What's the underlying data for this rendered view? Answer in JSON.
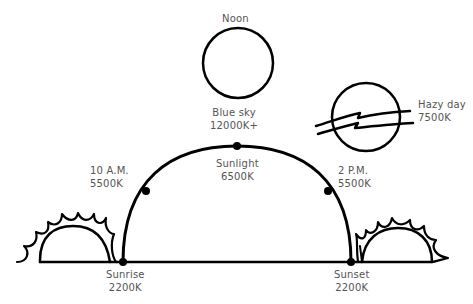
{
  "diagram": {
    "colors": {
      "stroke": "#000000",
      "text": "#555555",
      "background": "#ffffff"
    },
    "noon": {
      "label": "Noon"
    },
    "blue_sky": {
      "label": "Blue sky",
      "value": "12000K+"
    },
    "sunlight": {
      "label": "Sunlight",
      "value": "6500K"
    },
    "morning": {
      "label": "10 A.M.",
      "value": "5500K"
    },
    "afternoon": {
      "label": "2 P.M.",
      "value": "5500K"
    },
    "hazy": {
      "label": "Hazy day",
      "value": "7500K"
    },
    "sunrise": {
      "label": "Sunrise",
      "value": "2200K"
    },
    "sunset": {
      "label": "Sunset",
      "value": "2200K"
    }
  }
}
